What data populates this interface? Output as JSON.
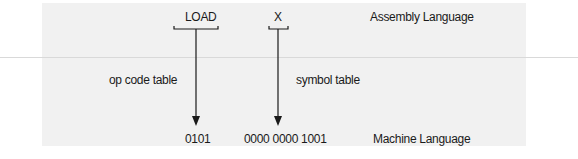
{
  "assembly": {
    "opcode": "LOAD",
    "operand": "X",
    "level_label": "Assembly Language"
  },
  "translations": {
    "opcode_via": "op code table",
    "operand_via": "symbol table"
  },
  "machine": {
    "opcode_bits": "0101",
    "operand_bits": "0000 0000 1001",
    "level_label": "Machine Language"
  },
  "colors": {
    "panel": "#f1f1f1",
    "stroke": "#1a1a1a",
    "rule": "#d9d9d9"
  }
}
